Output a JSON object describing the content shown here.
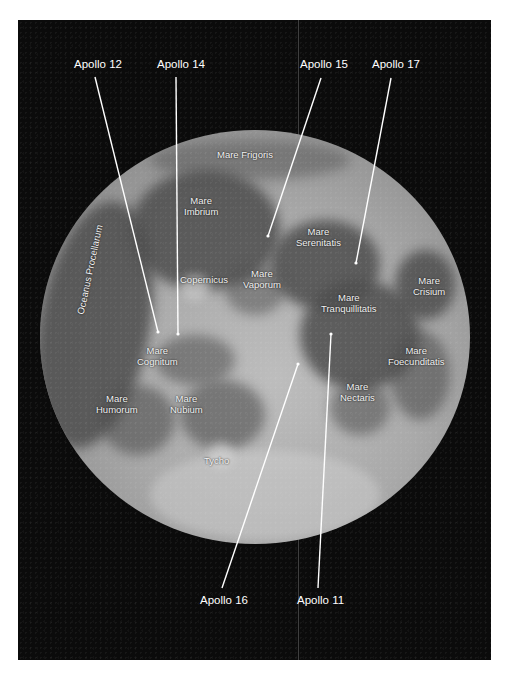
{
  "figure": {
    "background_color": "#0b0b0b",
    "label_color": "#ffffff"
  },
  "apollo_sites": [
    {
      "label": "Apollo 12",
      "label_pos": [
        74,
        57
      ],
      "line": [
        [
          95,
          77
        ],
        [
          158,
          332
        ]
      ]
    },
    {
      "label": "Apollo 14",
      "label_pos": [
        157,
        57
      ],
      "line": [
        [
          176,
          77
        ],
        [
          178,
          334
        ]
      ]
    },
    {
      "label": "Apollo 15",
      "label_pos": [
        300,
        57
      ],
      "line": [
        [
          321,
          78
        ],
        [
          268,
          236
        ]
      ]
    },
    {
      "label": "Apollo 17",
      "label_pos": [
        372,
        57
      ],
      "line": [
        [
          391,
          78
        ],
        [
          356,
          263
        ]
      ]
    },
    {
      "label": "Apollo 16",
      "label_pos": [
        200,
        593
      ],
      "line": [
        [
          222,
          588
        ],
        [
          298,
          364
        ]
      ]
    },
    {
      "label": "Apollo 11",
      "label_pos": [
        297,
        593
      ],
      "line": [
        [
          318,
          588
        ],
        [
          331,
          334
        ]
      ]
    }
  ],
  "features": {
    "mare_frigoris": "Mare Frigoris",
    "mare_imbrium": [
      "Mare",
      "Imbrium"
    ],
    "oceanus_procellarum": "Oceanus Procellarum",
    "copernicus": "Copernicus",
    "mare_vaporum": [
      "Mare",
      "Vaporum"
    ],
    "mare_serenitatis": [
      "Mare",
      "Serenitatis"
    ],
    "mare_tranquillitatis": [
      "Mare",
      "Tranquillitatis"
    ],
    "mare_crisium": [
      "Mare",
      "Crisium"
    ],
    "mare_cognitum": [
      "Mare",
      "Cognitum"
    ],
    "mare_humorum": [
      "Mare",
      "Humorum"
    ],
    "mare_nubium": [
      "Mare",
      "Nubium"
    ],
    "mare_nectaris": [
      "Mare",
      "Nectaris"
    ],
    "mare_foecunditatis": [
      "Mare",
      "Foecunditatis"
    ],
    "tycho": "Tycho"
  }
}
